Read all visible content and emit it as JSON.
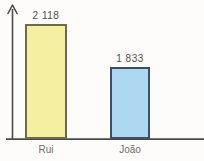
{
  "chart_data": {
    "type": "bar",
    "title": "",
    "xlabel": "",
    "ylabel": "",
    "grid": false,
    "legend": "none",
    "categories": [
      "Rui",
      "João"
    ],
    "values": [
      2118,
      1833
    ],
    "value_labels": [
      "2 118",
      "1 833"
    ],
    "bar_fill_colors": [
      "#f4efa1",
      "#aed8f2"
    ],
    "bar_border_colors": [
      "#6e6950",
      "#3f4e68"
    ],
    "axis_color": "#4a4a46",
    "value_text_color": "#4f4f4f",
    "category_text_color": "#6e6e6e",
    "background_color": "#fdfcfa"
  }
}
